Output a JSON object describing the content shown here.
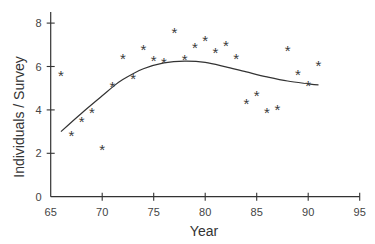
{
  "chart_data": {
    "type": "scatter",
    "title": "",
    "xlabel": "Year",
    "ylabel": "Individuals / Survey",
    "xlim": [
      65,
      95
    ],
    "ylim": [
      0,
      8.5
    ],
    "xticks": [
      65,
      70,
      75,
      80,
      85,
      90,
      95
    ],
    "yticks": [
      0,
      2,
      4,
      6,
      8
    ],
    "grid": false,
    "legend": null,
    "marker": "*",
    "series": [
      {
        "name": "observations",
        "type": "scatter",
        "x": [
          66,
          67,
          68,
          69,
          70,
          71,
          72,
          73,
          74,
          75,
          76,
          77,
          78,
          79,
          80,
          81,
          82,
          83,
          84,
          85,
          86,
          87,
          88,
          89,
          90,
          91
        ],
        "y": [
          5.6,
          2.85,
          3.5,
          3.9,
          2.2,
          5.1,
          6.4,
          5.45,
          6.8,
          6.3,
          6.2,
          7.6,
          6.35,
          6.9,
          7.2,
          6.65,
          7.0,
          6.4,
          4.3,
          4.7,
          3.9,
          4.05,
          6.75,
          5.65,
          5.15,
          6.05
        ]
      },
      {
        "name": "smoothed fit",
        "type": "line",
        "x": [
          66,
          68,
          70,
          71,
          72,
          74,
          76,
          78,
          80,
          82,
          84,
          86,
          88,
          90,
          91
        ],
        "y": [
          3.0,
          3.85,
          4.65,
          5.05,
          5.4,
          5.9,
          6.17,
          6.25,
          6.19,
          5.98,
          5.75,
          5.52,
          5.33,
          5.2,
          5.15
        ]
      }
    ]
  }
}
